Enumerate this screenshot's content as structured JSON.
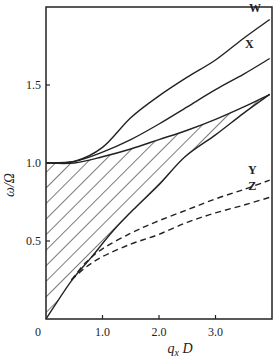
{
  "chart_data": {
    "type": "line",
    "title": "",
    "xlabel": "q_x D",
    "ylabel": "ω/Ω",
    "xlim": [
      0,
      4.0
    ],
    "ylim": [
      0,
      2.0
    ],
    "grid": false,
    "legend": "inline labels at right",
    "x_ticks": [
      {
        "value": 1.0,
        "label": "1.0"
      },
      {
        "value": 2.0,
        "label": "2.0"
      },
      {
        "value": 3.0,
        "label": "3.0"
      }
    ],
    "y_ticks": [
      {
        "value": 0.5,
        "label": "0.5"
      },
      {
        "value": 1.0,
        "label": "1.0"
      },
      {
        "value": 1.5,
        "label": "1.5"
      }
    ],
    "origin_label": "0",
    "series": [
      {
        "name": "W",
        "style": "solid",
        "x": [
          0,
          0.5,
          1.0,
          1.5,
          2.0,
          2.5,
          3.0,
          3.5,
          3.96
        ],
        "y": [
          1.0,
          1.01,
          1.1,
          1.29,
          1.43,
          1.55,
          1.66,
          1.8,
          1.92
        ]
      },
      {
        "name": "X",
        "style": "solid",
        "x": [
          0,
          0.5,
          1.0,
          1.5,
          2.0,
          2.5,
          3.0,
          3.5,
          3.96
        ],
        "y": [
          1.0,
          1.01,
          1.07,
          1.15,
          1.25,
          1.36,
          1.47,
          1.57,
          1.67
        ]
      },
      {
        "name": "shaded-upper",
        "style": "solid",
        "x": [
          0,
          0.5,
          1.0,
          1.5,
          2.0,
          2.5,
          3.0,
          3.5,
          3.96
        ],
        "y": [
          1.0,
          1.0,
          1.04,
          1.09,
          1.15,
          1.21,
          1.28,
          1.36,
          1.44
        ]
      },
      {
        "name": "shaded-lower",
        "style": "solid",
        "x": [
          0,
          0.44,
          0.79,
          1.2,
          1.6,
          2.0,
          2.46,
          3.0,
          3.5,
          3.96
        ],
        "y": [
          0,
          0.24,
          0.39,
          0.57,
          0.72,
          0.86,
          1.04,
          1.18,
          1.32,
          1.44
        ]
      },
      {
        "name": "Y",
        "style": "dashed",
        "x": [
          0.45,
          0.7,
          1.0,
          1.5,
          1.93,
          2.5,
          3.0,
          3.5,
          3.96
        ],
        "y": [
          0.25,
          0.36,
          0.45,
          0.55,
          0.62,
          0.7,
          0.77,
          0.83,
          0.89
        ]
      },
      {
        "name": "Z",
        "style": "dashed",
        "x": [
          0.45,
          0.7,
          1.0,
          1.5,
          1.98,
          2.5,
          3.0,
          3.5,
          3.96
        ],
        "y": [
          0.25,
          0.33,
          0.4,
          0.48,
          0.54,
          0.62,
          0.68,
          0.73,
          0.78
        ]
      }
    ],
    "shaded_region": {
      "between": [
        "shaded-upper",
        "shaded-lower"
      ],
      "fill": "diagonal hatch"
    },
    "annotations": [
      {
        "text": "W",
        "x": 3.7,
        "y": 1.97
      },
      {
        "text": "X",
        "x": 3.6,
        "y": 1.74
      },
      {
        "text": "Y",
        "x": 3.65,
        "y": 0.93
      },
      {
        "text": "Z",
        "x": 3.65,
        "y": 0.83
      }
    ]
  },
  "colors": {
    "ink": "#222222",
    "background": "#ffffff"
  }
}
